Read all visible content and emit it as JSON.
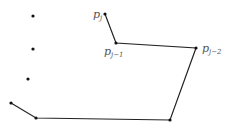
{
  "diagram": {
    "colors": {
      "line": "#222222",
      "point": "#111111",
      "label": "#555555"
    },
    "labels": {
      "pj": {
        "base": "p",
        "sub": "j"
      },
      "pj1": {
        "base": "p",
        "sub": "j−1"
      },
      "pj2": {
        "base": "p",
        "sub": "j−2"
      }
    },
    "polyline_points": [
      {
        "x": 105,
        "y": 14
      },
      {
        "x": 116,
        "y": 43
      },
      {
        "x": 196,
        "y": 48
      },
      {
        "x": 170,
        "y": 120
      },
      {
        "x": 36,
        "y": 118
      },
      {
        "x": 11,
        "y": 103
      }
    ],
    "isolated_points": [
      {
        "x": 33,
        "y": 16
      },
      {
        "x": 33,
        "y": 49
      },
      {
        "x": 28,
        "y": 79
      }
    ]
  }
}
